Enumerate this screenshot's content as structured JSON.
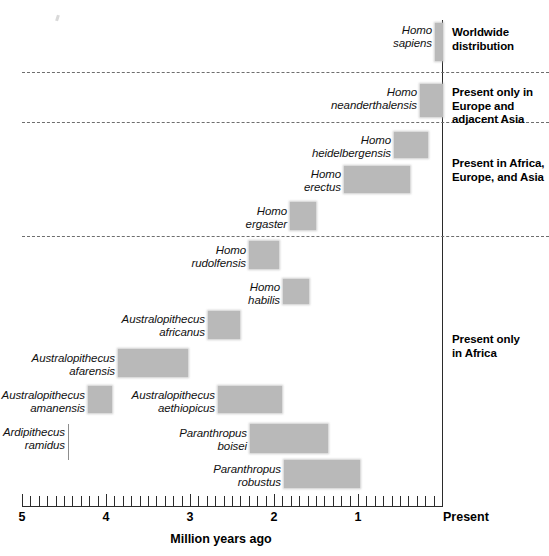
{
  "figure": {
    "axis": {
      "title": "Million years ago",
      "present_label": "Present",
      "tick_labels": [
        "5",
        "4",
        "3",
        "2",
        "1"
      ],
      "tick_values": [
        5,
        4,
        3,
        2,
        1
      ],
      "minor_tick_step": 0.1,
      "range_start_mya": 5.0,
      "range_end_mya": 0.0
    },
    "groups": [
      {
        "caption": "Worldwide\ndistribution"
      },
      {
        "caption": "Present only in\nEurope and\nadjacent Asia"
      },
      {
        "caption": "Present in Africa,\nEurope, and Asia"
      },
      {
        "caption": "Present only\nin Africa"
      }
    ]
  },
  "chart_data": {
    "type": "bar",
    "title": "",
    "xlabel": "Million years ago",
    "ylabel": "",
    "xlim": [
      5.0,
      0.0
    ],
    "x_tick_labels": [
      "5",
      "4",
      "3",
      "2",
      "1",
      "Present"
    ],
    "grid": false,
    "legend": "none",
    "orientation": "horizontal-ranges",
    "note": "Each bar is the fossil time-range of one hominin species, in millions of years before present. Dashed lines divide geographic-distribution groups.",
    "categories": [
      "Homo sapiens",
      "Homo neanderthalensis",
      "Homo heidelbergensis",
      "Homo erectus",
      "Homo ergaster",
      "Homo rudolfensis",
      "Homo habilis",
      "Australopithecus africanus",
      "Australopithecus afarensis",
      "Australopithecus amanensis",
      "Australopithecus aethiopicus",
      "Ardipithecus ramidus",
      "Paranthropus boisei",
      "Paranthropus robustus"
    ],
    "ranges_mya": [
      [
        0.2,
        0.0
      ],
      [
        0.35,
        0.0
      ],
      [
        0.6,
        0.2
      ],
      [
        1.2,
        0.4
      ],
      [
        1.8,
        1.5
      ],
      [
        2.3,
        2.0
      ],
      [
        1.9,
        1.6
      ],
      [
        2.8,
        2.4
      ],
      [
        3.9,
        3.05
      ],
      [
        4.2,
        3.95
      ],
      [
        2.65,
        1.9
      ],
      [
        4.4,
        4.4
      ],
      [
        2.3,
        1.35
      ],
      [
        1.9,
        1.0
      ]
    ],
    "groups": [
      "Worldwide distribution",
      "Present only in Europe and adjacent Asia",
      "Present in Africa, Europe, and Asia",
      "Present only in Africa"
    ]
  },
  "species": [
    {
      "name": "Homo\nsapiens",
      "label_right": 432,
      "label_top": 24,
      "bar_left": 435,
      "bar_top": 23,
      "bar_w": 8,
      "bar_h": 38,
      "style": "bar"
    },
    {
      "name": "Homo\nneanderthalensis",
      "label_right": 417,
      "label_top": 86,
      "bar_left": 420,
      "bar_top": 84,
      "bar_w": 23,
      "bar_h": 33,
      "style": "bar"
    },
    {
      "name": "Homo\nheidelbergensis",
      "label_right": 391,
      "label_top": 134,
      "bar_left": 394,
      "bar_top": 132,
      "bar_w": 34,
      "bar_h": 26,
      "style": "bar"
    },
    {
      "name": "Homo\nerectus",
      "label_right": 341,
      "label_top": 168,
      "bar_left": 344,
      "bar_top": 166,
      "bar_w": 66,
      "bar_h": 27,
      "style": "bar"
    },
    {
      "name": "Homo\nergaster",
      "label_right": 287,
      "label_top": 205,
      "bar_left": 290,
      "bar_top": 202,
      "bar_w": 26,
      "bar_h": 28,
      "style": "bar"
    },
    {
      "name": "Homo\nrudolfensis",
      "label_right": 246,
      "label_top": 244,
      "bar_left": 249,
      "bar_top": 241,
      "bar_w": 30,
      "bar_h": 28,
      "style": "bar"
    },
    {
      "name": "Homo\nhabilis",
      "label_right": 280,
      "label_top": 281,
      "bar_left": 283,
      "bar_top": 279,
      "bar_w": 26,
      "bar_h": 25,
      "style": "bar"
    },
    {
      "name": "Australopithecus\nafricanus",
      "label_right": 205,
      "label_top": 313,
      "bar_left": 208,
      "bar_top": 311,
      "bar_w": 32,
      "bar_h": 28,
      "style": "bar"
    },
    {
      "name": "Australopithecus\nafarensis",
      "label_right": 115,
      "label_top": 352,
      "bar_left": 118,
      "bar_top": 349,
      "bar_w": 70,
      "bar_h": 28,
      "style": "bar"
    },
    {
      "name": "Australopithecus\namanensis",
      "label_right": 85,
      "label_top": 389,
      "bar_left": 88,
      "bar_top": 386,
      "bar_w": 24,
      "bar_h": 27,
      "style": "bar"
    },
    {
      "name": "Australopithecus\naethiopicus",
      "label_right": 215,
      "label_top": 389,
      "bar_left": 218,
      "bar_top": 386,
      "bar_w": 64,
      "bar_h": 27,
      "style": "bar"
    },
    {
      "name": "Ardipithecus\nramidus",
      "label_right": 65,
      "label_top": 426,
      "bar_left": 68,
      "bar_top": 424,
      "bar_w": 1,
      "bar_h": 36,
      "style": "tick"
    },
    {
      "name": "Paranthropus\nboisei",
      "label_right": 247,
      "label_top": 427,
      "bar_left": 250,
      "bar_top": 424,
      "bar_w": 78,
      "bar_h": 29,
      "style": "bar"
    },
    {
      "name": "Paranthropus\nrobustus",
      "label_right": 281,
      "label_top": 463,
      "bar_left": 284,
      "bar_top": 460,
      "bar_w": 76,
      "bar_h": 28,
      "style": "bar"
    }
  ],
  "separators": [
    {
      "top": 72,
      "width": 527
    },
    {
      "top": 122,
      "width": 527
    },
    {
      "top": 236,
      "width": 527
    }
  ],
  "group_captions": [
    {
      "top": 26,
      "key": 0
    },
    {
      "top": 86,
      "key": 1
    },
    {
      "top": 157,
      "key": 2
    },
    {
      "top": 333,
      "key": 3
    }
  ]
}
